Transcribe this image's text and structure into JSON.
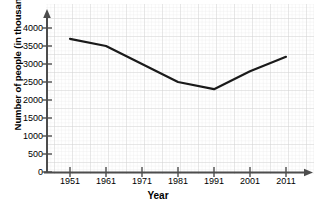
{
  "chart_data": {
    "type": "line",
    "title": "",
    "xlabel": "Year",
    "ylabel": "Number of people (in thousands)",
    "categories": [
      1951,
      1961,
      1971,
      1981,
      1991,
      2001,
      2011
    ],
    "x_ticks": [
      "1951",
      "1961",
      "1971",
      "1981",
      "1991",
      "2001",
      "2011"
    ],
    "values": [
      3700,
      3500,
      3000,
      2500,
      2300,
      2800,
      3200
    ],
    "series": [
      {
        "name": "Number of people",
        "values": [
          3700,
          3500,
          3000,
          2500,
          2300,
          2800,
          3200
        ]
      }
    ],
    "ylim": [
      0,
      4000
    ],
    "y_ticks": [
      0,
      500,
      1000,
      1500,
      2000,
      2500,
      3000,
      3500,
      4000
    ],
    "y_tick_labels": [
      "0",
      "500",
      "1000",
      "1500",
      "2000",
      "2500",
      "3000",
      "3500",
      "4000"
    ],
    "xlim": [
      1946,
      2016
    ],
    "grid": true,
    "grid_style": "graph-paper",
    "legend": "none",
    "line_color": "#1a1a1a",
    "grid_color": "#d9d9d9",
    "axis_color": "#4d4d4d",
    "background_color": "#ffffff"
  },
  "axes": {
    "y_axis_name": "y-axis",
    "x_axis_name": "x-axis",
    "y_arrow": "arrow-up",
    "x_arrow": "arrow-right"
  }
}
